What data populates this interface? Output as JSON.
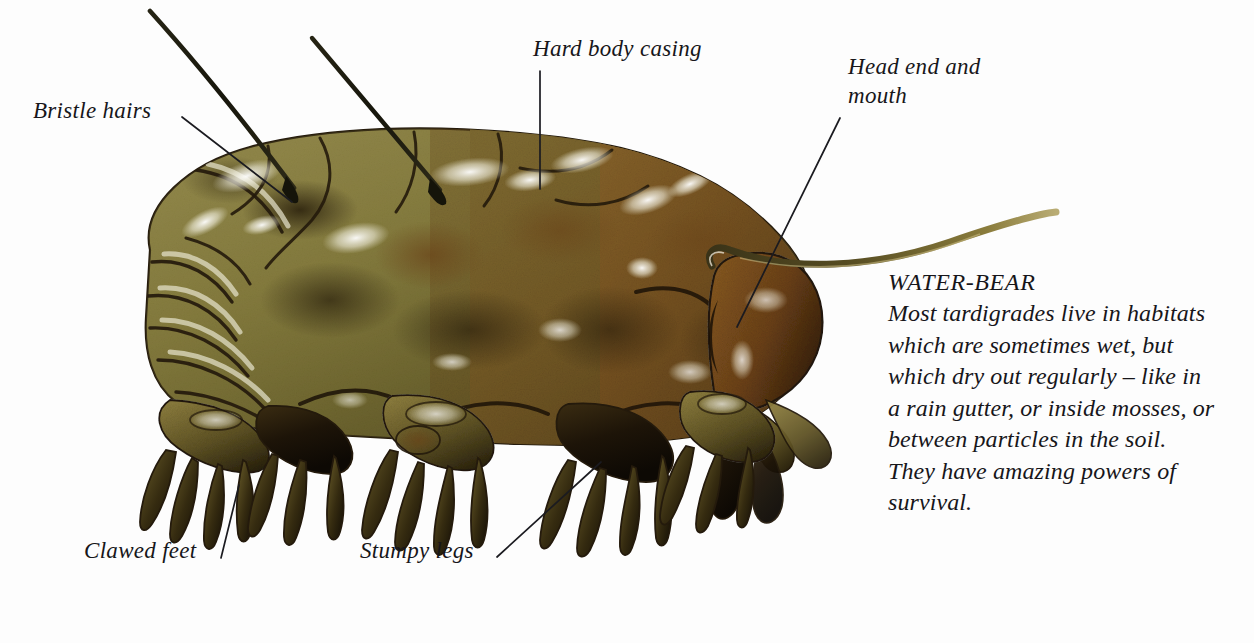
{
  "figure": {
    "background_color": "#fdfdfd"
  },
  "labels": {
    "bristle_hairs": "Bristle hairs",
    "hard_body_casing": "Hard body casing",
    "head_end_and_mouth": "Head end and\nmouth",
    "clawed_feet": "Clawed feet",
    "stumpy_legs": "Stumpy legs"
  },
  "caption": {
    "title": "WATER-BEAR",
    "body": "Most tardigrades live in habitats which are sometimes wet, but which dry out regularly – like in a rain gutter, or inside mosses, or between particles in the soil. They have amazing powers of survival."
  },
  "colors": {
    "body_olive": "#8a8240",
    "body_olive_dark": "#5d5724",
    "body_brown": "#7a4f20",
    "body_brown_dark": "#4a2c10",
    "highlight": "#f2f0e4",
    "outline": "#241a0c",
    "shadow": "#120c06",
    "text": "#17161a",
    "leader_line": "#1b1b20"
  }
}
